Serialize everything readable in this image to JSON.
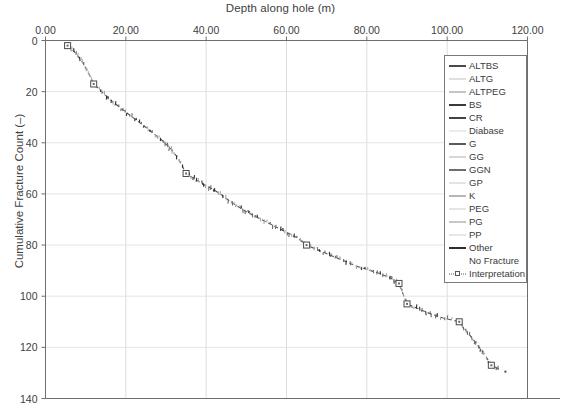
{
  "chart_data": {
    "type": "line",
    "title": "",
    "xlabel": "Depth along hole (m)",
    "ylabel": "Cumulative Fracture Count (–)",
    "xlim": [
      0,
      120
    ],
    "ylim": [
      0,
      140
    ],
    "y_inverted": true,
    "grid": true,
    "x_ticks": [
      0,
      20,
      40,
      60,
      80,
      100,
      120
    ],
    "x_tick_labels": [
      "0.00",
      "20.00",
      "40.00",
      "60.00",
      "80.00",
      "100.00",
      "120.00"
    ],
    "y_ticks": [
      0,
      20,
      40,
      60,
      80,
      100,
      120,
      140
    ],
    "y_tick_labels": [
      "0",
      "20",
      "40",
      "60",
      "80",
      "100",
      "120",
      "140"
    ],
    "legend_position": "upper right",
    "series": [
      {
        "name": "Interpretation",
        "style": "dashed-with-square-markers",
        "color": "#555555",
        "x": [
          5.5,
          7.5,
          9.0,
          10.5,
          12.0,
          14.0,
          16.0,
          18.0,
          20.0,
          22.5,
          25.0,
          27.0,
          29.0,
          31.0,
          33.0,
          35.0,
          37.0,
          39.0,
          41.5,
          44.0,
          46.0,
          48.0,
          50.0,
          52.5,
          55.0,
          57.5,
          60.0,
          62.5,
          65.0,
          68.0,
          71.0,
          74.0,
          77.0,
          80.0,
          83.0,
          86.0,
          88.0,
          90.0,
          93.0,
          96.0,
          99.0,
          103.0,
          105.0,
          107.0,
          109.0,
          111.0,
          113.0
        ],
        "y": [
          2.0,
          5.0,
          8.0,
          12.0,
          17.0,
          20.0,
          23.0,
          25.5,
          28.0,
          31.0,
          34.0,
          36.5,
          39.0,
          42.0,
          46.0,
          52.0,
          54.0,
          56.0,
          58.0,
          60.5,
          63.0,
          65.0,
          67.0,
          69.0,
          71.0,
          73.0,
          75.0,
          77.0,
          80.0,
          82.0,
          84.0,
          86.0,
          88.0,
          89.5,
          91.0,
          93.0,
          95.0,
          103.0,
          105.0,
          107.0,
          108.5,
          110.0,
          114.0,
          118.0,
          122.0,
          127.0,
          128.5
        ],
        "markers_x": [
          5.5,
          12.0,
          35.0,
          65.0,
          88.0,
          90.0,
          103.0,
          111.0
        ],
        "markers_y": [
          2.0,
          17.0,
          52.0,
          80.0,
          95.0,
          103.0,
          110.0,
          127.0
        ]
      }
    ],
    "legend_entries": [
      {
        "label": "ALTBS",
        "color": "#4a4a4a",
        "weight": 2.0,
        "style": "solid"
      },
      {
        "label": "ALTG",
        "color": "#c2c2c2",
        "weight": 1.6,
        "style": "solid"
      },
      {
        "label": "ALTPEG",
        "color": "#8c8c8c",
        "weight": 1.8,
        "style": "solid"
      },
      {
        "label": "BS",
        "color": "#3a3a3a",
        "weight": 2.6,
        "style": "solid"
      },
      {
        "label": "CR",
        "color": "#434343",
        "weight": 2.2,
        "style": "solid"
      },
      {
        "label": "Diabase",
        "color": "#d8d8d8",
        "weight": 1.4,
        "style": "solid"
      },
      {
        "label": "G",
        "color": "#5a5a5a",
        "weight": 2.0,
        "style": "solid"
      },
      {
        "label": "GG",
        "color": "#b0b0b0",
        "weight": 1.6,
        "style": "solid"
      },
      {
        "label": "GGN",
        "color": "#6e6e6e",
        "weight": 2.0,
        "style": "solid"
      },
      {
        "label": "GP",
        "color": "#c8c8c8",
        "weight": 1.5,
        "style": "solid"
      },
      {
        "label": "K",
        "color": "#707070",
        "weight": 1.9,
        "style": "solid"
      },
      {
        "label": "PEG",
        "color": "#cccccc",
        "weight": 1.5,
        "style": "solid"
      },
      {
        "label": "PG",
        "color": "#8f8f8f",
        "weight": 1.8,
        "style": "solid"
      },
      {
        "label": "PP",
        "color": "#cfcfcf",
        "weight": 1.5,
        "style": "solid"
      },
      {
        "label": "Other",
        "color": "#2e2e2e",
        "weight": 2.6,
        "style": "solid"
      },
      {
        "label": "No Fracture",
        "color": "#ffffff",
        "weight": 1.4,
        "style": "none"
      },
      {
        "label": "Interpretation",
        "color": "#555555",
        "weight": 1.2,
        "style": "dotted-marker"
      }
    ]
  },
  "axes": {
    "x_title": "Depth along hole (m)",
    "y_title": "Cumulative Fracture Count (–)"
  }
}
